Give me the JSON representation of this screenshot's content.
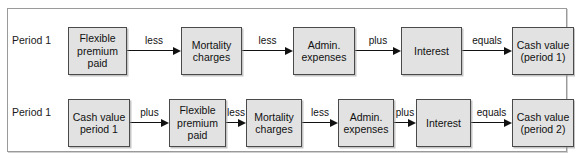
{
  "diagram": {
    "rows": [
      {
        "id": "row-1",
        "period_label": "Period 1",
        "nodes": [
          {
            "id": "flexible-premium-paid",
            "text": "Flexible\npremium\npaid",
            "x": 60,
            "y": 18,
            "w": 59,
            "h": 48
          },
          {
            "id": "mortality-charges",
            "text": "Mortality\ncharges",
            "x": 173,
            "y": 18,
            "w": 61,
            "h": 48
          },
          {
            "id": "admin-expenses",
            "text": "Admin.\nexpenses",
            "x": 285,
            "y": 18,
            "w": 62,
            "h": 48
          },
          {
            "id": "interest",
            "text": "Interest",
            "x": 393,
            "y": 18,
            "w": 61,
            "h": 48
          },
          {
            "id": "cash-value-period-1",
            "text": "Cash value\n(period 1)",
            "x": 504,
            "y": 18,
            "w": 62,
            "h": 48
          }
        ],
        "connectors": [
          {
            "id": "conn-1",
            "label": "less",
            "x": 119,
            "y": 36,
            "w": 54
          },
          {
            "id": "conn-2",
            "label": "less",
            "x": 234,
            "y": 36,
            "w": 51
          },
          {
            "id": "conn-3",
            "label": "plus",
            "x": 347,
            "y": 36,
            "w": 46
          },
          {
            "id": "conn-4",
            "label": "equals",
            "x": 454,
            "y": 36,
            "w": 50
          }
        ]
      },
      {
        "id": "row-2",
        "period_label": "Period 1",
        "nodes": [
          {
            "id": "cash-value-period-1-input",
            "text": "Cash value\nperiod 1",
            "x": 60,
            "y": 18,
            "w": 62,
            "h": 48
          },
          {
            "id": "flexible-premium-paid-2",
            "text": "Flexible\npremium\npaid",
            "x": 161,
            "y": 18,
            "w": 57,
            "h": 48
          },
          {
            "id": "mortality-charges-2",
            "text": "Mortality\ncharges",
            "x": 238,
            "y": 18,
            "w": 56,
            "h": 48
          },
          {
            "id": "admin-expenses-2",
            "text": "Admin.\nexpenses",
            "x": 330,
            "y": 18,
            "w": 56,
            "h": 48
          },
          {
            "id": "interest-2",
            "text": "Interest",
            "x": 408,
            "y": 18,
            "w": 55,
            "h": 48
          },
          {
            "id": "cash-value-period-2",
            "text": "Cash value\n(period 2)",
            "x": 504,
            "y": 18,
            "w": 62,
            "h": 48
          }
        ],
        "connectors": [
          {
            "id": "conn-5",
            "label": "plus",
            "x": 122,
            "y": 36,
            "w": 39
          },
          {
            "id": "conn-6",
            "label": "less",
            "x": 218,
            "y": 36,
            "w": 20
          },
          {
            "id": "conn-7",
            "label": "less",
            "x": 294,
            "y": 36,
            "w": 36
          },
          {
            "id": "conn-8",
            "label": "plus",
            "x": 386,
            "y": 36,
            "w": 22
          },
          {
            "id": "conn-9",
            "label": "equals",
            "x": 463,
            "y": 36,
            "w": 41
          }
        ]
      }
    ]
  },
  "colors": {
    "node_fill": "#e2e2e2",
    "node_border": "#4a4a4a",
    "frame_border": "#9a9a9a",
    "text": "#111111",
    "background": "#ffffff"
  }
}
